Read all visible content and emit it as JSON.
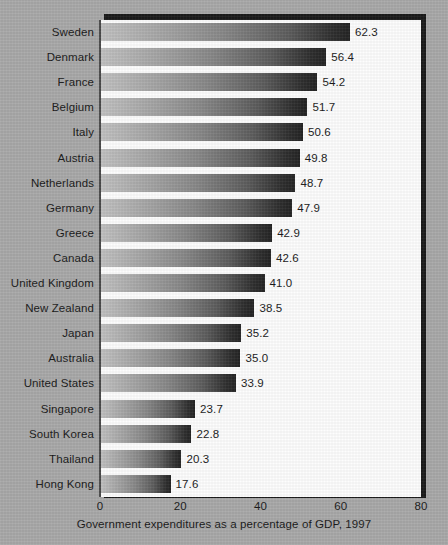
{
  "chart_data": {
    "type": "bar",
    "orientation": "horizontal",
    "title": "",
    "caption": "Government expenditures as a percentage of GDP, 1997",
    "xlabel": "Government expenditures as a percentage of GDP, 1997",
    "ylabel": "",
    "xlim": [
      0,
      80
    ],
    "xticks": [
      0,
      20,
      40,
      60,
      80
    ],
    "xtick_labels": [
      "0",
      "20",
      "40",
      "60",
      "80"
    ],
    "grid": false,
    "legend": null,
    "value_label_format": "one-decimal",
    "categories": [
      "Sweden",
      "Denmark",
      "France",
      "Belgium",
      "Italy",
      "Austria",
      "Netherlands",
      "Germany",
      "Greece",
      "Canada",
      "United Kingdom",
      "New Zealand",
      "Japan",
      "Australia",
      "United States",
      "Singapore",
      "South Korea",
      "Thailand",
      "Hong Kong"
    ],
    "values": [
      62.3,
      56.4,
      54.2,
      51.7,
      50.6,
      49.8,
      48.7,
      47.9,
      42.9,
      42.6,
      41.0,
      38.5,
      35.2,
      35.0,
      33.9,
      23.7,
      22.8,
      20.3,
      17.6
    ],
    "value_labels": [
      "62.3",
      "56.4",
      "54.2",
      "51.7",
      "50.6",
      "49.8",
      "48.7",
      "47.9",
      "42.9",
      "42.6",
      "41.0",
      "38.5",
      "35.2",
      "35.0",
      "33.9",
      "23.7",
      "22.8",
      "20.3",
      "17.6"
    ]
  },
  "colors": {
    "background": "#a9a9a9",
    "panel": "#fdfdfd",
    "panel_shadow": "#1c1c1c",
    "axis": "#4a4a4a",
    "text": "#1a1a1a",
    "bar_gradient_start": "#c2c2c2",
    "bar_gradient_end": "#242424"
  }
}
